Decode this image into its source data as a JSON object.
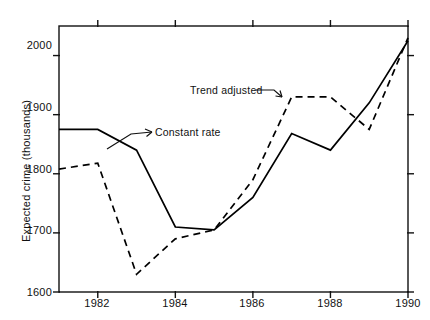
{
  "chart_data": {
    "type": "line",
    "title": "",
    "xlabel": "",
    "ylabel": "Expected crime (thousands)",
    "x": [
      1981,
      1982,
      1983,
      1984,
      1985,
      1986,
      1987,
      1988,
      1989,
      1990
    ],
    "xlim": [
      1981,
      1990
    ],
    "ylim": [
      1600,
      2050
    ],
    "grid": false,
    "legend_position": "inline-annotations",
    "x_ticks": [
      1982,
      1984,
      1986,
      1988,
      1990
    ],
    "x_tick_labels": [
      "1982",
      "1984",
      "1986",
      "1988",
      "1990"
    ],
    "y_ticks": [
      1600,
      1700,
      1800,
      1900,
      2000
    ],
    "y_tick_labels": [
      "1600",
      "1700",
      "1800",
      "1900",
      "2000"
    ],
    "series": [
      {
        "name": "Constant rate",
        "style": "solid",
        "color": "#000000",
        "values": [
          1875,
          1875,
          1840,
          1710,
          1705,
          1760,
          1868,
          1840,
          1920,
          2025
        ]
      },
      {
        "name": "Trend adjusted",
        "style": "dashed",
        "color": "#000000",
        "values": [
          1808,
          1818,
          1630,
          1690,
          1705,
          1790,
          1930,
          1930,
          1875,
          2030
        ]
      }
    ],
    "annotations": [
      {
        "text": "Constant rate",
        "target_series": "Constant rate"
      },
      {
        "text": "Trend adjusted",
        "target_series": "Trend adjusted"
      }
    ]
  },
  "axes": {
    "y_title": "Expected crime (thousands)"
  }
}
